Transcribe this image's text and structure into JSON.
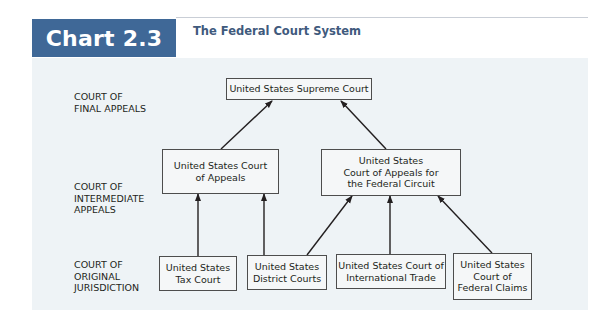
{
  "header": {
    "badge": "Chart 2.3",
    "title": "The Federal Court System",
    "badge_color": "#3f6897",
    "title_color": "#3f5a7d"
  },
  "levels": [
    {
      "id": "final",
      "label_line1": "COURT OF",
      "label_line2": "FINAL APPEALS",
      "label_line3": ""
    },
    {
      "id": "intermediate",
      "label_line1": "COURT OF",
      "label_line2": "INTERMEDIATE",
      "label_line3": "APPEALS"
    },
    {
      "id": "original",
      "label_line1": "COURT OF",
      "label_line2": "ORIGINAL",
      "label_line3": "JURISDICTION"
    }
  ],
  "nodes": {
    "supreme": {
      "line1": "United States Supreme Court",
      "line2": "",
      "line3": ""
    },
    "appeals": {
      "line1": "United States Court",
      "line2": "of Appeals",
      "line3": ""
    },
    "federal_circuit": {
      "line1": "United States",
      "line2": "Court of Appeals for",
      "line3": "the Federal Circuit"
    },
    "tax": {
      "line1": "United States",
      "line2": "Tax Court",
      "line3": ""
    },
    "district": {
      "line1": "United States",
      "line2": "District Courts",
      "line3": ""
    },
    "intl_trade": {
      "line1": "United States Court of",
      "line2": "International Trade",
      "line3": ""
    },
    "federal_claims": {
      "line1": "United States",
      "line2": "Court of",
      "line3": "Federal Claims"
    }
  },
  "edges": [
    {
      "from": "United States Court of Appeals",
      "to": "United States Supreme Court"
    },
    {
      "from": "United States Court of Appeals for the Federal Circuit",
      "to": "United States Supreme Court"
    },
    {
      "from": "United States Tax Court",
      "to": "United States Court of Appeals"
    },
    {
      "from": "United States District Courts",
      "to": "United States Court of Appeals"
    },
    {
      "from": "United States District Courts",
      "to": "United States Court of Appeals for the Federal Circuit"
    },
    {
      "from": "United States Court of International Trade",
      "to": "United States Court of Appeals for the Federal Circuit"
    },
    {
      "from": "United States Court of Federal Claims",
      "to": "United States Court of Appeals for the Federal Circuit"
    }
  ]
}
